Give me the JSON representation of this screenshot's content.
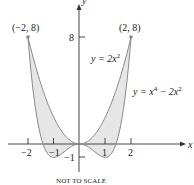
{
  "figure": {
    "axes": {
      "x_label": "x",
      "y_label": "y",
      "x_ticks": [
        {
          "value": -2,
          "label": "−2"
        },
        {
          "value": -1,
          "label": "−1"
        },
        {
          "value": 1,
          "label": "1"
        },
        {
          "value": 2,
          "label": "2"
        }
      ],
      "y_ticks": [
        {
          "value": 8,
          "label": "8"
        },
        {
          "value": -1,
          "label": "−1"
        }
      ]
    },
    "points": [
      {
        "label": "(−2, 8)",
        "x": -2,
        "y": 8
      },
      {
        "label": "(2, 8)",
        "x": 2,
        "y": 8
      }
    ],
    "curves": [
      {
        "name": "upper",
        "label": "y = 2x²",
        "eq_base": "y = 2x",
        "eq_sup": "2"
      },
      {
        "name": "lower",
        "label": "y = x⁴ − 2x²",
        "eq_base1": "y = x",
        "eq_sup1": "4",
        "eq_mid": " − 2x",
        "eq_sup2": "2"
      }
    ],
    "shaded_region": "between y = 2x² and y = x⁴ − 2x² on [−2, 2]",
    "note": "NOT TO SCALE",
    "colors": {
      "curve": "#8a8a8a",
      "fill": "#e6e6e6",
      "axis": "#333333",
      "point": "#888888"
    }
  }
}
